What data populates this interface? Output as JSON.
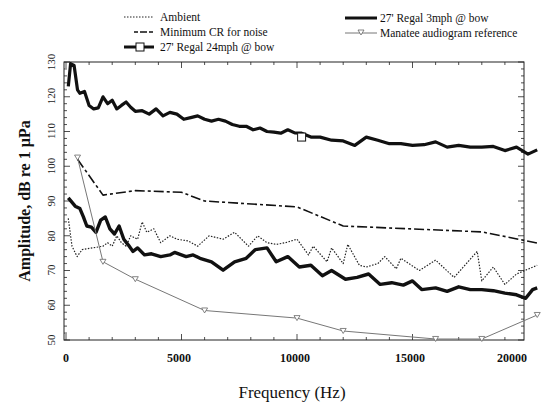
{
  "chart_data": {
    "type": "line",
    "title": "",
    "xlabel": "Frequency (Hz)",
    "ylabel": "Amplitude, dB re 1 µPa",
    "xlim": [
      0,
      20400
    ],
    "ylim": [
      50,
      130
    ],
    "xticks": [
      0,
      5000,
      10000,
      15000,
      20000
    ],
    "xtick_labels": [
      "0",
      "5000",
      "10000",
      "15000",
      "20000"
    ],
    "yticks": [
      50,
      60,
      70,
      80,
      90,
      100,
      110,
      120,
      130
    ],
    "ytick_labels": [
      "50",
      "60",
      "70",
      "80",
      "90",
      "100",
      "110",
      "120",
      "130"
    ],
    "grid": false,
    "legend_position": "top",
    "legend": [
      {
        "label": "Ambient",
        "style": "dotted",
        "series": "ambient"
      },
      {
        "label": "Minimum CR for noise",
        "style": "dashdot",
        "series": "min_cr"
      },
      {
        "label": "27' Regal 24mph @ bow",
        "style": "thick-square",
        "series": "regal_24"
      },
      {
        "label": "27' Regal 3mph @ bow",
        "style": "thick",
        "series": "regal_3"
      },
      {
        "label": "Manatee audiogram reference",
        "style": "thin-triangle",
        "series": "manatee"
      }
    ],
    "series": [
      {
        "key": "ambient",
        "name": "Ambient",
        "x": [
          100,
          260,
          480,
          700,
          1600,
          1800,
          2000,
          2200,
          2400,
          2600,
          2800,
          3100,
          3300,
          3500,
          3800,
          4100,
          4500,
          4800,
          5300,
          5700,
          6200,
          6800,
          7300,
          7900,
          8300,
          8700,
          9100,
          9500,
          10000,
          10500,
          10700,
          11300,
          11500,
          12000,
          12200,
          12700,
          13000,
          13500,
          13800,
          14300,
          14500,
          15300,
          16000,
          16800,
          17800,
          18000,
          18500,
          19000,
          19500,
          20400
        ],
        "y": [
          85,
          77,
          74,
          76,
          77,
          78,
          77,
          80,
          78,
          77,
          80,
          79,
          84,
          81,
          82,
          78,
          80,
          79,
          78.5,
          77,
          80,
          79,
          81,
          77,
          80,
          78,
          77.5,
          78,
          79,
          74.5,
          77,
          72.5,
          76.5,
          72,
          77.5,
          71.5,
          71,
          72,
          74,
          70.5,
          73.5,
          70,
          73,
          68,
          75.5,
          67,
          71,
          66,
          69,
          71.5
        ]
      },
      {
        "key": "min_cr",
        "name": "Minimum CR for noise",
        "x": [
          500,
          1600,
          3000,
          5000,
          6000,
          10000,
          12000,
          18000,
          20400
        ],
        "y": [
          102,
          91.7,
          93,
          92.5,
          90,
          88.3,
          82.8,
          81.1,
          77.9
        ]
      },
      {
        "key": "regal_24",
        "name": "27' Regal 24mph @ bow",
        "marker_at": [
          10200,
          108.4
        ],
        "x": [
          100,
          200,
          350,
          500,
          600,
          800,
          1000,
          1200,
          1400,
          1600,
          1800,
          2000,
          2200,
          2400,
          2600,
          2800,
          3000,
          3300,
          3600,
          3900,
          4200,
          4500,
          4800,
          5100,
          5400,
          5700,
          6000,
          6300,
          6600,
          6900,
          7200,
          7500,
          7800,
          8100,
          8400,
          8700,
          9000,
          9300,
          9600,
          9900,
          10200,
          10600,
          11000,
          11500,
          12000,
          12500,
          13000,
          13500,
          14000,
          14500,
          15000,
          15500,
          16000,
          16500,
          17000,
          17500,
          18000,
          18500,
          19000,
          19500,
          20000,
          20400
        ],
        "y": [
          123,
          129.5,
          129,
          122,
          121,
          121.5,
          117.5,
          116.5,
          116.8,
          120,
          118,
          119,
          116.5,
          117.5,
          118.5,
          117,
          115.8,
          116,
          115,
          116.5,
          114.5,
          115.5,
          115,
          113.5,
          114,
          114.5,
          113.5,
          113,
          113.5,
          113,
          112,
          111.5,
          111.5,
          110.5,
          111,
          110,
          109.8,
          109.5,
          110.5,
          109.6,
          109.5,
          108.4,
          108.4,
          107.5,
          107.3,
          106,
          108.4,
          107.5,
          106.5,
          106.5,
          106,
          106.2,
          107,
          105.5,
          106,
          105.5,
          105.5,
          105.7,
          104.5,
          105.5,
          103.5,
          104.7
        ]
      },
      {
        "key": "regal_3",
        "name": "27' Regal 3mph @ bow",
        "x": [
          100,
          400,
          600,
          750,
          900,
          1100,
          1300,
          1500,
          1700,
          1900,
          2100,
          2300,
          2500,
          2700,
          2900,
          3100,
          3400,
          3700,
          4100,
          4500,
          4700,
          5200,
          5500,
          5800,
          6300,
          6800,
          7300,
          7800,
          8200,
          8700,
          9100,
          9600,
          10100,
          10600,
          11100,
          11500,
          12100,
          12600,
          13100,
          13600,
          14100,
          14600,
          15000,
          15400,
          16000,
          16500,
          17000,
          17500,
          18000,
          18500,
          19000,
          19500,
          19900,
          20200,
          20400
        ],
        "y": [
          90.9,
          88.5,
          87.8,
          85.5,
          82.8,
          82.5,
          81,
          84.5,
          85.4,
          82,
          80.5,
          82.8,
          79,
          77.3,
          75.5,
          76.5,
          74.5,
          74.8,
          74,
          74.5,
          75.2,
          74,
          74.5,
          73.5,
          72.5,
          70.1,
          72.5,
          73.5,
          76,
          76.5,
          72.5,
          74,
          71,
          71.5,
          68.5,
          70,
          67.5,
          68,
          69,
          66,
          66.5,
          65.8,
          67,
          64.5,
          65,
          64,
          65.3,
          64.5,
          64.5,
          64.2,
          63.5,
          63,
          62,
          64.5,
          65
        ]
      },
      {
        "key": "manatee",
        "name": "Manatee audiogram reference",
        "x": [
          500,
          1600,
          3000,
          6000,
          10000,
          12000,
          16000,
          18000,
          20400
        ],
        "y": [
          102.5,
          72.5,
          67.5,
          58.5,
          56.3,
          52.6,
          50.3,
          50.3,
          57.2
        ]
      }
    ]
  },
  "legend": {
    "ambient": "Ambient",
    "min_cr": "Minimum CR for noise",
    "regal_24": "27' Regal 24mph @ bow",
    "regal_3": "27' Regal 3mph @ bow",
    "manatee": "Manatee audiogram reference"
  },
  "axes": {
    "xlabel": "Frequency (Hz)",
    "ylabel": "Amplitude, dB re 1 µPa",
    "xtick_labels": [
      "0",
      "5000",
      "10000",
      "15000",
      "20000"
    ],
    "ytick_labels": [
      "50",
      "60",
      "70",
      "80",
      "90",
      "100",
      "110",
      "120",
      "130"
    ]
  },
  "colors": {
    "line": "#111111",
    "manatee": "#666666",
    "background": "#ffffff"
  }
}
